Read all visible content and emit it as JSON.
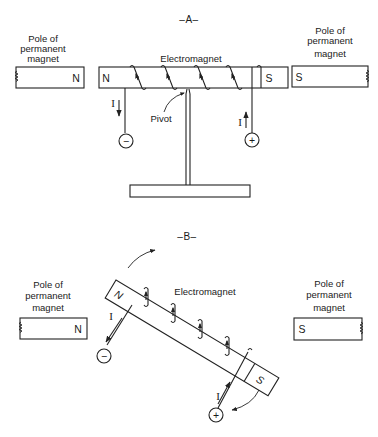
{
  "panel_a": {
    "title": "–A–",
    "left_magnet": {
      "label_line1": "Pole of",
      "label_line2": "permanent",
      "label_line3": "magnet",
      "pole": "N"
    },
    "right_magnet": {
      "label_line1": "Pole of",
      "label_line2": "permanent",
      "label_line3": "magnet",
      "pole": "S"
    },
    "electromagnet": {
      "label": "Electromagnet",
      "left_pole": "N",
      "right_pole": "S"
    },
    "pivot_label": "Pivot",
    "current_left": "I",
    "current_right": "I",
    "terminal_negative": "−",
    "terminal_positive": "+"
  },
  "panel_b": {
    "title": "–B–",
    "left_magnet": {
      "label_line1": "Pole of",
      "label_line2": "permanent",
      "label_line3": "magnet",
      "pole": "N"
    },
    "right_magnet": {
      "label_line1": "Pole of",
      "label_line2": "permanent",
      "label_line3": "magnet",
      "pole": "S"
    },
    "electromagnet": {
      "label": "Electromagnet",
      "left_pole": "N",
      "right_pole": "S"
    },
    "current_left": "I",
    "current_right": "I",
    "terminal_negative": "−",
    "terminal_positive": "+"
  }
}
